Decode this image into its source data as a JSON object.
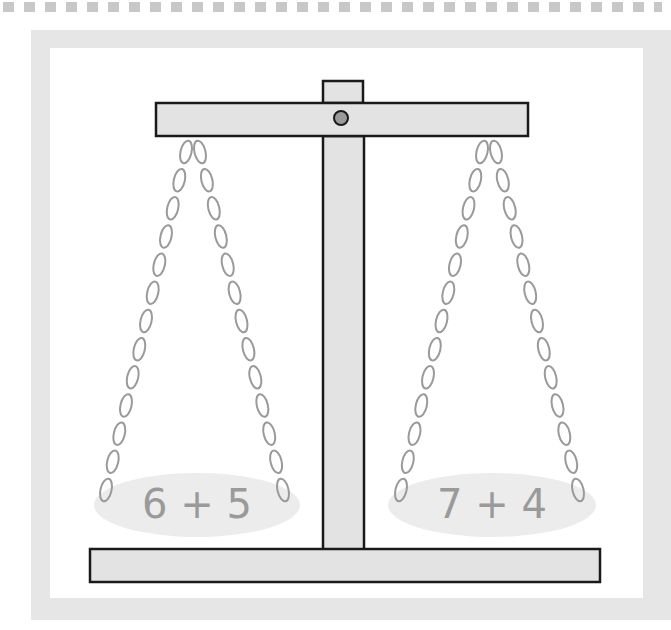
{
  "diagram": {
    "type": "balance-scale",
    "left_pan": {
      "label": "6 + 5"
    },
    "right_pan": {
      "label": "7 + 4"
    }
  },
  "colors": {
    "frame": "#e6e6e6",
    "wood_fill": "#e3e3e3",
    "outline": "#1a1a1a",
    "chain": "#9a9a9a",
    "pan": "#ececec",
    "label_text": "#9a9a9a",
    "pivot": "#9a9a9a",
    "dash": "#c8c8c8"
  }
}
